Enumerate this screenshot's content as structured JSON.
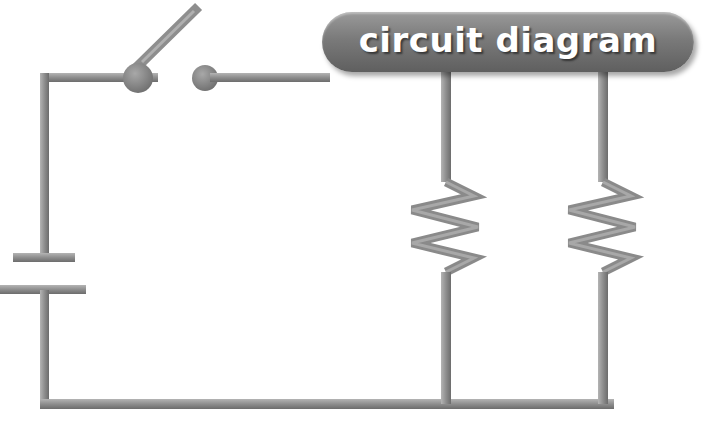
{
  "title": "circuit diagram",
  "colors": {
    "wire": "#8c8c8c",
    "wire_dark": "#6e6e6e",
    "wire_light": "#b0b0b0",
    "background": "#ffffff",
    "label_pill": "#7a7a7a",
    "label_text": "#ffffff"
  },
  "components": [
    {
      "type": "battery",
      "label": "battery-cell"
    },
    {
      "type": "switch",
      "state": "open"
    },
    {
      "type": "resistor",
      "index": 1
    },
    {
      "type": "resistor",
      "index": 2
    }
  ],
  "layout": {
    "configuration": "parallel resistors with open switch and battery"
  }
}
